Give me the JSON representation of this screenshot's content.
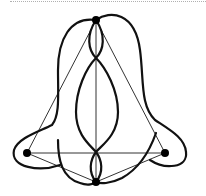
{
  "diagram": {
    "type": "graph-drawing",
    "colors": {
      "curve": "#111111",
      "edge": "#333333",
      "vertex": "#000000",
      "background": "#ffffff",
      "rule": "#b0b0b0"
    },
    "vertices": [
      {
        "id": "top",
        "x": 96,
        "y": 20
      },
      {
        "id": "left",
        "x": 27,
        "y": 153
      },
      {
        "id": "right",
        "x": 165,
        "y": 153
      },
      {
        "id": "bottom",
        "x": 96,
        "y": 182
      }
    ],
    "edges": [
      [
        "top",
        "left"
      ],
      [
        "top",
        "right"
      ],
      [
        "top",
        "bottom"
      ],
      [
        "left",
        "right"
      ],
      [
        "left",
        "bottom"
      ],
      [
        "right",
        "bottom"
      ]
    ]
  }
}
